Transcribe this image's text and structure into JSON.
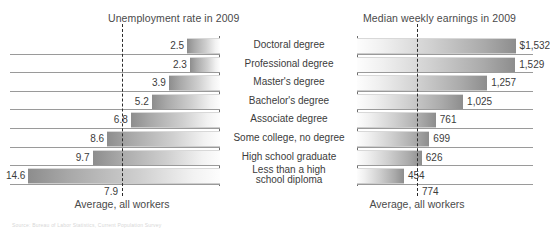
{
  "chart_data": {
    "type": "bar",
    "orientation": "horizontal-diverging",
    "categories": [
      "Doctoral degree",
      "Professional degree",
      "Master's degree",
      "Bachelor's degree",
      "Associate degree",
      "Some college, no degree",
      "High school graduate",
      "Less than a high\nschool diploma"
    ],
    "panels": [
      {
        "id": "unemployment",
        "title": "Unemployment rate in 2009",
        "direction": "left",
        "unit": "percent",
        "values": [
          2.5,
          2.3,
          3.9,
          5.2,
          6.8,
          8.6,
          9.7,
          14.6
        ],
        "value_labels": [
          "2.5",
          "2.3",
          "3.9",
          "5.2",
          "6.8",
          "8.6",
          "9.7",
          "14.6"
        ],
        "average": 7.9,
        "average_label": "7.9",
        "average_caption": "Average, all workers",
        "xlim": [
          0,
          16
        ]
      },
      {
        "id": "earnings",
        "title": "Median weekly earnings in 2009",
        "direction": "right",
        "unit": "dollars per week",
        "values": [
          1532,
          1529,
          1257,
          1025,
          761,
          699,
          626,
          454
        ],
        "value_labels": [
          "$1,532",
          "1,529",
          "1,257",
          "1,025",
          "761",
          "699",
          "626",
          "454"
        ],
        "average": 774,
        "average_label": "774",
        "average_caption": "Average, all workers",
        "xlim": [
          0,
          1700
        ]
      }
    ],
    "colors": {
      "bar_dark": "#8d8d8d",
      "bar_light": "#fdfdfd",
      "axis": "#6e6e6e",
      "average_line": "#2b2b2b",
      "text": "#3c3c3c"
    },
    "grid": false,
    "legend": null
  },
  "footnote": {
    "text": "Source: Bureau of Labor Statistics, Current Population Survey"
  }
}
